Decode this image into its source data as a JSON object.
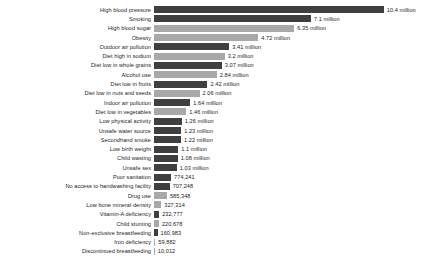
{
  "chart_data": {
    "type": "bar",
    "orientation": "horizontal",
    "title": "",
    "subtitle": "",
    "xlabel": "",
    "ylabel": "",
    "grid": false,
    "legend": "none",
    "xlim": [
      0,
      10.4
    ],
    "value_unit": "deaths",
    "categories": [
      "High blood pressure",
      "Smoking",
      "High blood sugar",
      "Obesity",
      "Outdoor air pollution",
      "Diet high in sodium",
      "Diet low in whole grains",
      "Alcohol use",
      "Diet low in fruits",
      "Diet low in nuts and seeds",
      "Indoor air pollution",
      "Diet low in vegetables",
      "Low physical activity",
      "Unsafe water source",
      "Secondhand smoke",
      "Low birth weight",
      "Child wasting",
      "Unsafe sex",
      "Poor sanitation",
      "No access to handwashing facility",
      "Drug use",
      "Low bone mineral density",
      "Vitamin-A deficiency",
      "Child stunting",
      "Non-exclusive breastfeeding",
      "Iron deficiency",
      "Discontinued breastfeeding"
    ],
    "values": [
      10400000,
      7100000,
      6350000,
      4720000,
      3410000,
      3200000,
      3070000,
      2840000,
      2420000,
      2060000,
      1640000,
      1460000,
      1260000,
      1230000,
      1220000,
      1100000,
      1080000,
      1030000,
      774241,
      707248,
      585348,
      327314,
      232777,
      220678,
      160983,
      59882,
      10012
    ],
    "value_labels": [
      "10.4 million",
      "7.1 million",
      "6.35 million",
      "4.72 million",
      "3.41 million",
      "3.2 million",
      "3.07 million",
      "2.84 million",
      "2.42 million",
      "2.06 million",
      "1.64 million",
      "1.46 million",
      "1.26 million",
      "1.23 million",
      "1.22 million",
      "1.1 million",
      "1.08 million",
      "1.03 million",
      "774,241",
      "707,248",
      "585,348",
      "327,314",
      "232,777",
      "220,678",
      "160,983",
      "59,882",
      "10,012"
    ],
    "bar_colors": [
      "#3f3f3f",
      "#3f3f3f",
      "#a8a8a8",
      "#a8a8a8",
      "#3f3f3f",
      "#a8a8a8",
      "#3f3f3f",
      "#a8a8a8",
      "#3f3f3f",
      "#a8a8a8",
      "#3f3f3f",
      "#a8a8a8",
      "#3f3f3f",
      "#3f3f3f",
      "#3f3f3f",
      "#3f3f3f",
      "#3f3f3f",
      "#3f3f3f",
      "#3f3f3f",
      "#3f3f3f",
      "#a8a8a8",
      "#a8a8a8",
      "#3f3f3f",
      "#a8a8a8",
      "#3f3f3f",
      "#a8a8a8",
      "#a8a8a8"
    ]
  },
  "style": {
    "background": "#ffffff",
    "text_color": "#222222",
    "dark_bar": "#3f3f3f",
    "light_bar": "#a8a8a8",
    "plot_left_px": 157,
    "px_per_million": 22.1,
    "row_pitch_px": 9.3,
    "bar_height_px": 7,
    "first_row_top_px": 5
  }
}
